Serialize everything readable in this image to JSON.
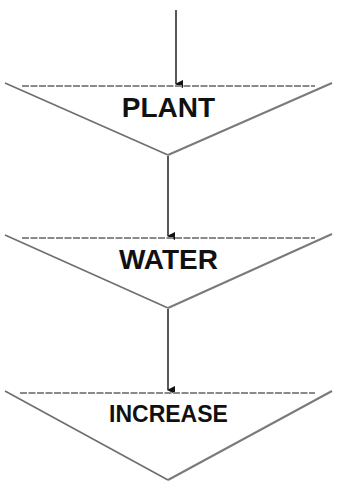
{
  "diagram": {
    "type": "flowchart",
    "direction": "top-to-bottom",
    "shape": "inverted-triangle",
    "colors": {
      "background": "#ffffff",
      "outline": "#6e6e6e",
      "top_edge": "#8a8a8a",
      "arrow": "#111111",
      "text": "#111111"
    },
    "steps": [
      {
        "label": "PLANT"
      },
      {
        "label": "WATER"
      },
      {
        "label": "INCREASE"
      }
    ],
    "connectors": [
      {
        "from": "top",
        "to": "PLANT"
      },
      {
        "from": "PLANT",
        "to": "WATER"
      },
      {
        "from": "WATER",
        "to": "INCREASE"
      }
    ]
  }
}
